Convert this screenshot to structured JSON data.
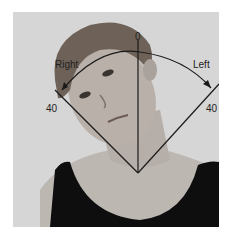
{
  "figure": {
    "labels": {
      "zero": "0",
      "right_direction": "Right",
      "left_direction": "Left",
      "right_angle": "40",
      "left_angle": "40"
    },
    "colors": {
      "background": "#d8d8d8",
      "lines": "#1a1a1a",
      "hair": "#6e6258",
      "skin": "#b8b0aa",
      "shirt": "#0e0e0e"
    }
  }
}
